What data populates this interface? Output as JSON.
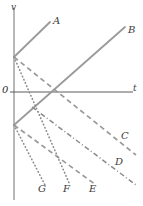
{
  "figure": {
    "type": "velocity-time-diagram",
    "title": "",
    "background": "#ffffff",
    "width": 143,
    "height": 206,
    "axes": {
      "vertical_label": "v",
      "horizontal_label": "t",
      "origin_label": "0",
      "origin_px": [
        14,
        92
      ],
      "axis_color": "#4a4a4a",
      "vaxis_color": "#9a9a9a",
      "taxis_color": "#4a4a4a"
    },
    "palette": {
      "line_gray": "#9a9a9a",
      "line_dark": "#8a8a8a",
      "text": "#3c3c3c"
    },
    "nodes": [
      {
        "name": "upper-intercept",
        "px": [
          14,
          57
        ]
      },
      {
        "name": "lower-intercept",
        "px": [
          14,
          125
        ]
      },
      {
        "name": "axis-crossing",
        "px": [
          56,
          92
        ]
      },
      {
        "name": "line-b-point",
        "px": [
          32,
          107
        ]
      }
    ],
    "lines": [
      {
        "id": "A",
        "label": "A",
        "style": "solid",
        "color": "#9a9a9a",
        "from": [
          14,
          57
        ],
        "to": [
          50,
          22
        ],
        "label_px": [
          53,
          21
        ]
      },
      {
        "id": "B",
        "label": "B",
        "style": "solid",
        "color": "#9a9a9a",
        "from": [
          14,
          125
        ],
        "to": [
          125,
          27
        ],
        "label_px": [
          128,
          30
        ]
      },
      {
        "id": "C",
        "label": "C",
        "style": "dashed",
        "color": "#9a9a9a",
        "from": [
          14,
          57
        ],
        "to": [
          136,
          155
        ],
        "label_px": [
          121,
          136
        ]
      },
      {
        "id": "D",
        "label": "D",
        "style": "dashdot",
        "color": "#8a8a8a",
        "from": [
          32,
          107
        ],
        "to": [
          136,
          185
        ],
        "label_px": [
          115,
          162
        ]
      },
      {
        "id": "E",
        "label": "E",
        "style": "dashed",
        "color": "#9a9a9a",
        "from": [
          14,
          125
        ],
        "to": [
          96,
          185
        ],
        "label_px": [
          89,
          189
        ]
      },
      {
        "id": "F",
        "label": "F",
        "style": "dotted",
        "color": "#8a8a8a",
        "from": [
          14,
          57
        ],
        "to": [
          70,
          185
        ],
        "label_px": [
          63,
          189
        ]
      },
      {
        "id": "G",
        "label": "G",
        "style": "dotted",
        "color": "#8a8a8a",
        "from": [
          14,
          125
        ],
        "to": [
          45,
          185
        ],
        "label_px": [
          38,
          189
        ]
      }
    ]
  }
}
